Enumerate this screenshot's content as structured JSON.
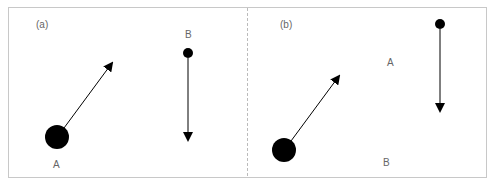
{
  "panels": [
    {
      "tag": "(a)",
      "labels": {
        "A": "A",
        "B": "B"
      }
    },
    {
      "tag": "(b)",
      "labels": {
        "A": "A",
        "B": "B"
      }
    }
  ],
  "colors": {
    "border": "#c8c8c8",
    "ink": "#000000",
    "text": "#666666"
  }
}
